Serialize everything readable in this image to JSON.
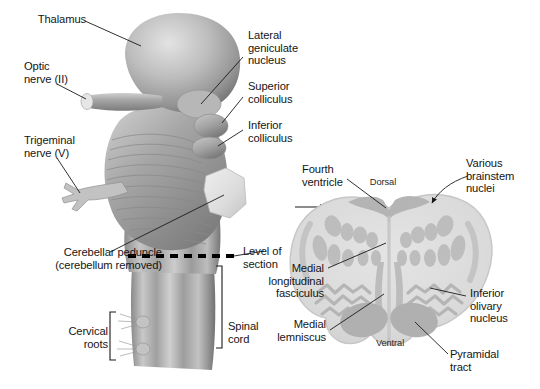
{
  "figure": {
    "type": "anatomical-illustration",
    "style": "grayscale airbrush rendering"
  },
  "colors": {
    "background": "#ffffff",
    "text": "#151515",
    "leader_line": "#1a1a1a",
    "brainstem_light": "#d9d9d9",
    "brainstem_mid": "#a8a8a8",
    "brainstem_dark": "#7d7d7d",
    "brainstem_shadow": "#5e5e5e",
    "section_fill": "#dcdcdc",
    "section_nuclei": "#bdbdbd",
    "section_tract": "#b0b0b0",
    "section_edge": "#c9c9c9",
    "dash_line": "#000000"
  },
  "left_panel": {
    "name": "brainstem-dorsal-view",
    "labels": [
      {
        "id": "thalamus",
        "text": "Thalamus"
      },
      {
        "id": "optic-nerve",
        "text": "Optic\nnerve (II)"
      },
      {
        "id": "trigeminal-nerve",
        "text": "Trigeminal\nnerve (V)"
      },
      {
        "id": "cerebellar-peduncle",
        "text": "Cerebellar peduncle\n(cerebellum removed)"
      },
      {
        "id": "cervical-roots",
        "text": "Cervical\nroots"
      },
      {
        "id": "spinal-cord",
        "text": "Spinal\ncord"
      },
      {
        "id": "lateral-geniculate",
        "text": "Lateral\ngeniculate\nnucleus"
      },
      {
        "id": "superior-colliculus",
        "text": "Superior\ncolliculus"
      },
      {
        "id": "inferior-colliculus",
        "text": "Inferior\ncolliculus"
      },
      {
        "id": "level-of-section",
        "text": "Level of\nsection"
      }
    ]
  },
  "right_panel": {
    "name": "medulla-cross-section",
    "labels": [
      {
        "id": "fourth-ventricle",
        "text": "Fourth\nventricle"
      },
      {
        "id": "dorsal",
        "text": "Dorsal"
      },
      {
        "id": "ventral",
        "text": "Ventral"
      },
      {
        "id": "various-nuclei",
        "text": "Various\nbrainstem\nnuclei"
      },
      {
        "id": "mlf",
        "text": "Medial\nlongitudinal\nfasciculus"
      },
      {
        "id": "medial-lemniscus",
        "text": "Medial\nlemniscus"
      },
      {
        "id": "inferior-olivary",
        "text": "Inferior\nolivary\nnucleus"
      },
      {
        "id": "pyramidal-tract",
        "text": "Pyramidal\ntract"
      }
    ]
  }
}
